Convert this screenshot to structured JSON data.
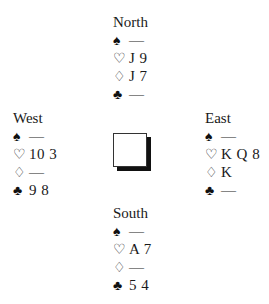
{
  "hands": {
    "north": {
      "name": "North",
      "spades": "—",
      "hearts": "J 9",
      "diamonds": "J 7",
      "clubs": "—"
    },
    "west": {
      "name": "West",
      "spades": "—",
      "hearts": "10 3",
      "diamonds": "—",
      "clubs": "9 8"
    },
    "east": {
      "name": "East",
      "spades": "—",
      "hearts": "K Q 8",
      "diamonds": "K",
      "clubs": "—"
    },
    "south": {
      "name": "South",
      "spades": "—",
      "hearts": "A 7",
      "diamonds": "—",
      "clubs": "5 4"
    }
  },
  "suit_symbols": {
    "spades": "♠",
    "hearts": "♡",
    "diamonds": "♢",
    "clubs": "♣"
  }
}
